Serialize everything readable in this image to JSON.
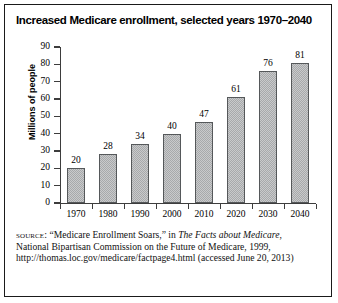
{
  "figure": {
    "title": "Increased Medicare enrollment, selected years 1970–2040"
  },
  "chart_data": {
    "type": "bar",
    "title": "Increased Medicare enrollment, selected years 1970–2040",
    "xlabel": "",
    "ylabel": "Millions of people",
    "categories": [
      "1970",
      "1980",
      "1990",
      "2000",
      "2010",
      "2020",
      "2030",
      "2040"
    ],
    "values": [
      20,
      28,
      34,
      40,
      47,
      61,
      76,
      81
    ],
    "data_labels": [
      "20",
      "28",
      "34",
      "40",
      "47",
      "61",
      "76",
      "81"
    ],
    "ylim": [
      0,
      90
    ],
    "yticks": [
      0,
      10,
      20,
      30,
      40,
      50,
      60,
      70,
      80,
      90
    ],
    "ytick_labels": [
      "0",
      "10",
      "20",
      "30",
      "40",
      "50",
      "60",
      "70",
      "80",
      "90"
    ],
    "grid": false,
    "legend": null,
    "bar_color": "#b9babb",
    "bar_edge_color": "#55585a",
    "axis_color": "#3d3d3d",
    "background": "#ffffff"
  },
  "source": {
    "label": "source:",
    "line1_a": " “Medicare Enrollment Soars,” in ",
    "line1_italic": "The Facts about Medicare",
    "line1_b": ",",
    "line2": "National Bipartisan Commission on the Future of Medicare, 1999,",
    "line3": "http://thomas.loc.gov/medicare/factpage4.html (accessed",
    "line4": "June 20, 2013)"
  }
}
